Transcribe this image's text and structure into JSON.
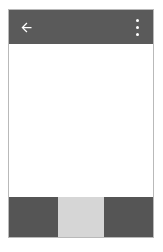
{
  "screen": {
    "name": "mobile-app-screen",
    "width": 163,
    "height": 252,
    "background_color": "#ffffff"
  },
  "colors": {
    "app_bar": "#5a5a5a",
    "bottom_bar": "#555555",
    "bottom_bar_active_segment": "#d6d6d6",
    "content_background": "#ffffff",
    "icon": "#ffffff",
    "frame_border": "#b9b9b9"
  },
  "app_bar": {
    "title": "",
    "back_icon": "arrow-back-icon",
    "overflow_icon": "overflow-menu-icon"
  },
  "content": {
    "text": "",
    "state": "empty"
  },
  "bottom_bar": {
    "segments": [
      {
        "label": "",
        "icon": "",
        "active": false
      },
      {
        "label": "",
        "icon": "",
        "active": true
      },
      {
        "label": "",
        "icon": "",
        "active": false
      }
    ]
  }
}
